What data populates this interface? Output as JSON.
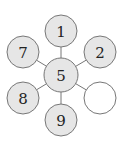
{
  "diagram": {
    "type": "hexagonal-number-puzzle",
    "colors": {
      "filled": "#e6e6e6",
      "empty": "#ffffff",
      "stroke": "#777777",
      "text": "#222222"
    },
    "center": {
      "label": "5",
      "x": 61,
      "y": 75,
      "r": 17
    },
    "nodes": [
      {
        "id": "top",
        "label": "1",
        "x": 61,
        "y": 31,
        "r": 16,
        "filled": true
      },
      {
        "id": "upper-right",
        "label": "2",
        "x": 100,
        "y": 52,
        "r": 16,
        "filled": true
      },
      {
        "id": "lower-right",
        "label": "",
        "x": 100,
        "y": 98,
        "r": 16,
        "filled": false
      },
      {
        "id": "bottom",
        "label": "9",
        "x": 61,
        "y": 120,
        "r": 16,
        "filled": true
      },
      {
        "id": "lower-left",
        "label": "8",
        "x": 23,
        "y": 98,
        "r": 16,
        "filled": true
      },
      {
        "id": "upper-left",
        "label": "7",
        "x": 23,
        "y": 52,
        "r": 16,
        "filled": true
      }
    ]
  }
}
